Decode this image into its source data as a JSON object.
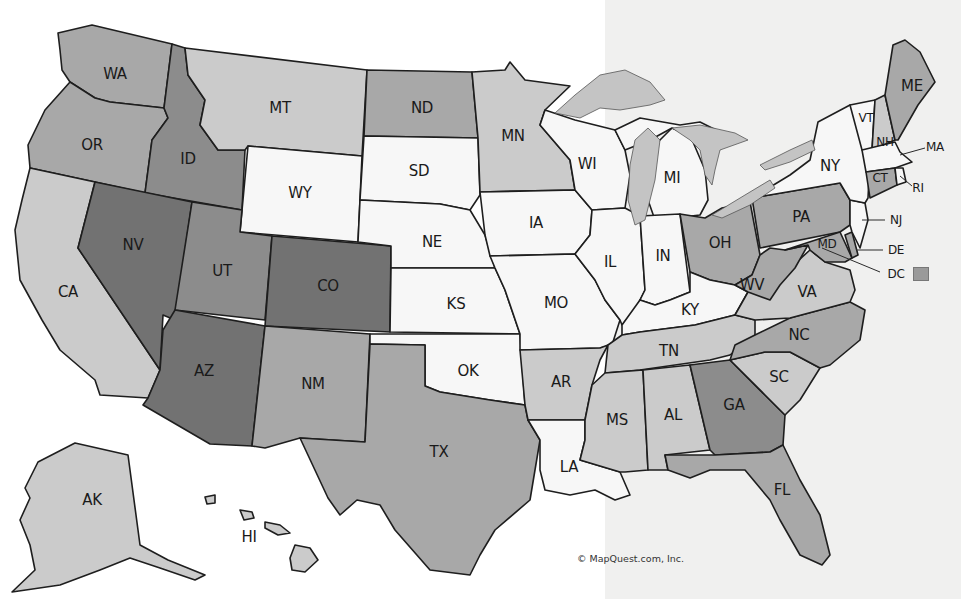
{
  "map": {
    "title": "United States",
    "copyright": "© MapQuest.com, Inc.",
    "shades": {
      "darkest": "#727272",
      "dark": "#8c8c8c",
      "medium": "#a8a8a8",
      "light": "#cbcbcb",
      "white": "#f7f7f7",
      "water": "#c4c4c4"
    },
    "states": [
      {
        "abbr": "WA",
        "shade": "medium",
        "lx": 115,
        "ly": 74
      },
      {
        "abbr": "OR",
        "shade": "medium",
        "lx": 92,
        "ly": 145
      },
      {
        "abbr": "CA",
        "shade": "light",
        "lx": 68,
        "ly": 292
      },
      {
        "abbr": "ID",
        "shade": "dark",
        "lx": 188,
        "ly": 159
      },
      {
        "abbr": "NV",
        "shade": "darkest",
        "lx": 133,
        "ly": 245
      },
      {
        "abbr": "MT",
        "shade": "light",
        "lx": 280,
        "ly": 108
      },
      {
        "abbr": "WY",
        "shade": "white",
        "lx": 300,
        "ly": 193
      },
      {
        "abbr": "UT",
        "shade": "dark",
        "lx": 222,
        "ly": 271
      },
      {
        "abbr": "CO",
        "shade": "darkest",
        "lx": 328,
        "ly": 286
      },
      {
        "abbr": "AZ",
        "shade": "darkest",
        "lx": 204,
        "ly": 371
      },
      {
        "abbr": "NM",
        "shade": "medium",
        "lx": 313,
        "ly": 384
      },
      {
        "abbr": "ND",
        "shade": "medium",
        "lx": 422,
        "ly": 108
      },
      {
        "abbr": "SD",
        "shade": "white",
        "lx": 419,
        "ly": 171
      },
      {
        "abbr": "NE",
        "shade": "white",
        "lx": 432,
        "ly": 242
      },
      {
        "abbr": "KS",
        "shade": "white",
        "lx": 456,
        "ly": 304
      },
      {
        "abbr": "OK",
        "shade": "white",
        "lx": 468,
        "ly": 371
      },
      {
        "abbr": "TX",
        "shade": "medium",
        "lx": 439,
        "ly": 452
      },
      {
        "abbr": "MN",
        "shade": "light",
        "lx": 513,
        "ly": 136
      },
      {
        "abbr": "IA",
        "shade": "white",
        "lx": 536,
        "ly": 223
      },
      {
        "abbr": "MO",
        "shade": "white",
        "lx": 556,
        "ly": 303
      },
      {
        "abbr": "AR",
        "shade": "light",
        "lx": 561,
        "ly": 382
      },
      {
        "abbr": "LA",
        "shade": "white",
        "lx": 569,
        "ly": 467
      },
      {
        "abbr": "WI",
        "shade": "white",
        "lx": 587,
        "ly": 164
      },
      {
        "abbr": "IL",
        "shade": "white",
        "lx": 610,
        "ly": 262
      },
      {
        "abbr": "MI",
        "shade": "white",
        "lx": 672,
        "ly": 178
      },
      {
        "abbr": "IN",
        "shade": "white",
        "lx": 663,
        "ly": 256
      },
      {
        "abbr": "OH",
        "shade": "medium",
        "lx": 720,
        "ly": 243
      },
      {
        "abbr": "KY",
        "shade": "white",
        "lx": 690,
        "ly": 310
      },
      {
        "abbr": "TN",
        "shade": "light",
        "lx": 669,
        "ly": 351
      },
      {
        "abbr": "MS",
        "shade": "light",
        "lx": 617,
        "ly": 420
      },
      {
        "abbr": "AL",
        "shade": "light",
        "lx": 673,
        "ly": 415
      },
      {
        "abbr": "GA",
        "shade": "dark",
        "lx": 734,
        "ly": 405
      },
      {
        "abbr": "FL",
        "shade": "medium",
        "lx": 782,
        "ly": 490
      },
      {
        "abbr": "SC",
        "shade": "light",
        "lx": 779,
        "ly": 377
      },
      {
        "abbr": "NC",
        "shade": "medium",
        "lx": 799,
        "ly": 335
      },
      {
        "abbr": "VA",
        "shade": "light",
        "lx": 807,
        "ly": 292
      },
      {
        "abbr": "WV",
        "shade": "medium",
        "lx": 752,
        "ly": 285
      },
      {
        "abbr": "PA",
        "shade": "medium",
        "lx": 801,
        "ly": 217
      },
      {
        "abbr": "NY",
        "shade": "white",
        "lx": 830,
        "ly": 166
      },
      {
        "abbr": "VT",
        "shade": "white",
        "lx": 866,
        "ly": 118
      },
      {
        "abbr": "NH",
        "shade": "light",
        "lx": 885,
        "ly": 142
      },
      {
        "abbr": "ME",
        "shade": "medium",
        "lx": 912,
        "ly": 86
      },
      {
        "abbr": "MA",
        "shade": "white",
        "lx": 935,
        "ly": 147
      },
      {
        "abbr": "CT",
        "shade": "medium",
        "lx": 880,
        "ly": 178
      },
      {
        "abbr": "RI",
        "shade": "white",
        "lx": 918,
        "ly": 188
      },
      {
        "abbr": "NJ",
        "shade": "white",
        "lx": 896,
        "ly": 220
      },
      {
        "abbr": "DE",
        "shade": "medium",
        "lx": 896,
        "ly": 250
      },
      {
        "abbr": "MD",
        "shade": "medium",
        "lx": 827,
        "ly": 244
      },
      {
        "abbr": "DC",
        "shade": "medium",
        "lx": 896,
        "ly": 274
      },
      {
        "abbr": "AK",
        "shade": "light",
        "lx": 92,
        "ly": 500
      },
      {
        "abbr": "HI",
        "shade": "light",
        "lx": 249,
        "ly": 537
      }
    ]
  }
}
